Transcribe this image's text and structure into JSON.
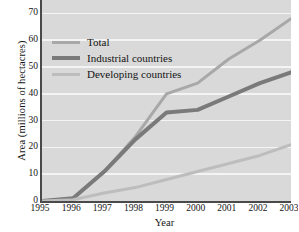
{
  "chart_data": {
    "type": "line",
    "title": "",
    "xlabel": "Year",
    "ylabel": "Area (millions of hectacres)",
    "x": [
      1995,
      1996,
      1997,
      1998,
      1999,
      2000,
      2001,
      2002,
      2003
    ],
    "categories": [
      "1995",
      "1996",
      "1997",
      "1998",
      "1999",
      "2000",
      "2001",
      "2002",
      "2003"
    ],
    "xlim": [
      1995,
      2003
    ],
    "ylim": [
      0,
      75
    ],
    "yticks": [
      0,
      10,
      20,
      30,
      40,
      50,
      60,
      70
    ],
    "ytick_labels": [
      "0",
      "10",
      "20",
      "30",
      "40",
      "50",
      "60",
      "70"
    ],
    "grid": true,
    "grid_axis": "y",
    "grid_color": "#f4f4f4",
    "plot_background": "#d9d9d9",
    "legend_position": "upper left",
    "series": [
      {
        "name": "Total",
        "color": "#a8a8a8",
        "width": 3,
        "values": [
          0,
          1,
          11,
          24,
          40,
          44,
          53,
          60,
          68
        ]
      },
      {
        "name": "Industrial countries",
        "color": "#7a7a7a",
        "width": 4,
        "values": [
          0,
          1,
          11,
          23,
          33,
          34,
          39,
          44,
          48
        ]
      },
      {
        "name": "Developing countries",
        "color": "#bdbdbd",
        "width": 3,
        "values": [
          0,
          0.5,
          3,
          5,
          8,
          11,
          14,
          17,
          21
        ]
      }
    ]
  },
  "legend": {
    "items": [
      {
        "label": "Total"
      },
      {
        "label": "Industrial countries"
      },
      {
        "label": "Developing countries"
      }
    ]
  },
  "axes": {
    "y_title": "Area (millions of hectacres)",
    "x_title": "Year"
  }
}
